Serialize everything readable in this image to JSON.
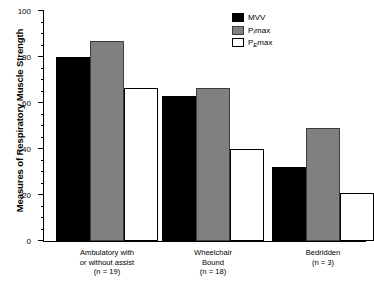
{
  "chart_data": {
    "type": "bar",
    "title": "",
    "xlabel": "",
    "ylabel": "Measures of Respiratory Muscle Strength",
    "ylim": [
      0,
      100
    ],
    "ytick_labels": [
      "0",
      "20",
      "40",
      "60",
      "80",
      "100"
    ],
    "ytick_values": [
      0,
      20,
      40,
      60,
      80,
      100
    ],
    "minor_tick_interval": 5,
    "grid": false,
    "legend_position": "top-right",
    "categories": [
      "Ambulatory with or without assist (n = 19)",
      "Wheelchair Bound (n = 18)",
      "Bedridden (n = 3)"
    ],
    "series": [
      {
        "name": "MVV",
        "color": "#000000",
        "values": [
          80,
          63,
          32
        ]
      },
      {
        "name": "PImax",
        "color": "#808080",
        "values": [
          87,
          66.5,
          49
        ]
      },
      {
        "name": "PEmax",
        "color": "#ffffff",
        "values": [
          66.5,
          40,
          21
        ]
      }
    ]
  },
  "axis": {
    "y_title": "Measures of Respiratory Muscle Strength",
    "ticks": [
      {
        "label": "100",
        "value": 100
      },
      {
        "label": "80",
        "value": 80
      },
      {
        "label": "60",
        "value": 60
      },
      {
        "label": "40",
        "value": 40
      },
      {
        "label": "20",
        "value": 20
      },
      {
        "label": "0",
        "value": 0
      }
    ]
  },
  "legend": {
    "items": [
      {
        "label": "MVV",
        "sub": "",
        "suffix": ""
      },
      {
        "label": "P",
        "sub": "I",
        "suffix": "max"
      },
      {
        "label": "P",
        "sub": "E",
        "suffix": "max"
      }
    ]
  },
  "groups": [
    {
      "line1": "Ambulatory with",
      "line2": "or without assist",
      "line3": "(n = 19)",
      "n": 19,
      "mvv": 80,
      "pimax": 87,
      "pemax": 66.5
    },
    {
      "line1": "Wheelchair",
      "line2": "Bound",
      "line3": "(n = 18)",
      "n": 18,
      "mvv": 63,
      "pimax": 66.5,
      "pemax": 40
    },
    {
      "line1": "Bedridden",
      "line2": "",
      "line3": "(n = 3)",
      "n": 3,
      "mvv": 32,
      "pimax": 49,
      "pemax": 21
    }
  ]
}
